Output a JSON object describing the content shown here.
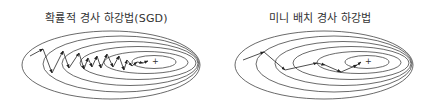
{
  "panels": [
    {
      "id": "sgd",
      "title": "확률적 경사 하강법(SGD)",
      "minimum_marker": "+",
      "ellipses": [
        {
          "cx": 111,
          "cy": 65,
          "rx": 89,
          "ry": 34
        },
        {
          "cx": 121,
          "cy": 64,
          "rx": 78,
          "ry": 28
        },
        {
          "cx": 130,
          "cy": 63.5,
          "rx": 68,
          "ry": 22
        },
        {
          "cx": 138,
          "cy": 63,
          "rx": 58,
          "ry": 16.5
        },
        {
          "cx": 146,
          "cy": 62.5,
          "rx": 42,
          "ry": 11
        },
        {
          "cx": 154,
          "cy": 62,
          "rx": 22,
          "ry": 6.5
        }
      ],
      "minimum": {
        "x": 150,
        "y": 61
      },
      "path": [
        [
          30,
          56
        ],
        [
          43,
          49
        ],
        [
          52,
          73
        ],
        [
          63,
          51
        ],
        [
          69,
          68
        ],
        [
          79,
          53
        ],
        [
          84,
          69
        ],
        [
          88,
          58
        ],
        [
          92,
          67
        ],
        [
          97,
          56
        ],
        [
          101,
          68
        ],
        [
          107,
          54
        ],
        [
          113,
          67
        ],
        [
          119,
          56
        ],
        [
          124,
          70
        ],
        [
          127,
          60
        ],
        [
          132,
          66
        ],
        [
          137,
          62
        ],
        [
          143,
          63
        ],
        [
          148,
          61
        ]
      ]
    },
    {
      "id": "mini-batch",
      "title": "미니 배치 경사 하강법",
      "minimum_marker": "+",
      "ellipses": [
        {
          "cx": 111,
          "cy": 65,
          "rx": 89,
          "ry": 34
        },
        {
          "cx": 121,
          "cy": 64,
          "rx": 78,
          "ry": 28
        },
        {
          "cx": 130,
          "cy": 63.5,
          "rx": 68,
          "ry": 22
        },
        {
          "cx": 138,
          "cy": 63,
          "rx": 58,
          "ry": 16.5
        },
        {
          "cx": 146,
          "cy": 62.5,
          "rx": 42,
          "ry": 11
        },
        {
          "cx": 154,
          "cy": 62,
          "rx": 22,
          "ry": 6.5
        }
      ],
      "minimum": {
        "x": 150,
        "y": 61
      },
      "path": [
        [
          30,
          60
        ],
        [
          51,
          52
        ],
        [
          72,
          70
        ],
        [
          104,
          63
        ],
        [
          112,
          65
        ],
        [
          128,
          72
        ],
        [
          144,
          65
        ],
        [
          148,
          62
        ]
      ]
    }
  ]
}
